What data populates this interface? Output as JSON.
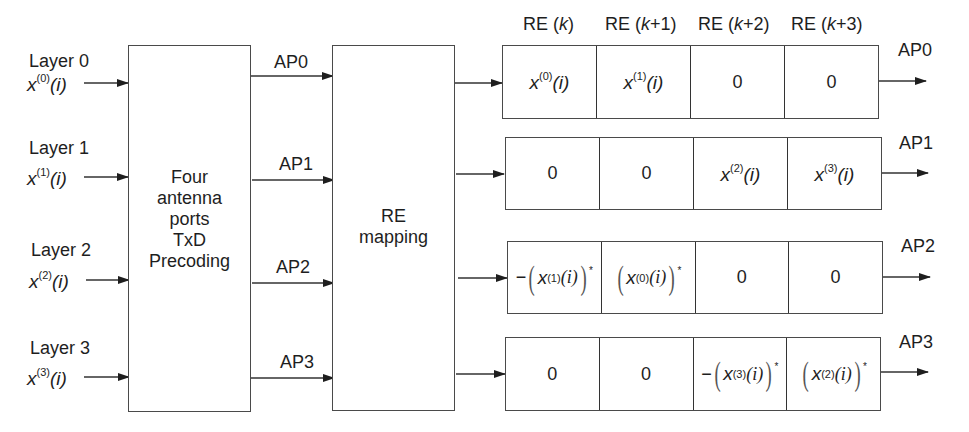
{
  "diagram": {
    "layers": [
      {
        "label": "Layer 0",
        "symbol_base": "x",
        "symbol_sup": "(0)",
        "symbol_arg": "(i)"
      },
      {
        "label": "Layer 1",
        "symbol_base": "x",
        "symbol_sup": "(1)",
        "symbol_arg": "(i)"
      },
      {
        "label": "Layer 2",
        "symbol_base": "x",
        "symbol_sup": "(2)",
        "symbol_arg": "(i)"
      },
      {
        "label": "Layer 3",
        "symbol_base": "x",
        "symbol_sup": "(3)",
        "symbol_arg": "(i)"
      }
    ],
    "precoding_block": {
      "lines": [
        "Four",
        "antenna",
        "ports",
        "TxD",
        "Precoding"
      ]
    },
    "mapping_block": {
      "lines": [
        "RE",
        "mapping"
      ]
    },
    "ap_links": [
      "AP0",
      "AP1",
      "AP2",
      "AP3"
    ],
    "re_headers": [
      {
        "prefix": "RE (",
        "var": "k",
        "suffix": ")"
      },
      {
        "prefix": "RE (",
        "var": "k",
        "suffix": "+1)"
      },
      {
        "prefix": "RE (",
        "var": "k",
        "suffix": "+2)"
      },
      {
        "prefix": "RE (",
        "var": "k",
        "suffix": "+3)"
      }
    ],
    "output_rows": [
      {
        "ap": "AP0",
        "cells": [
          {
            "type": "sym",
            "sup": "(0)"
          },
          {
            "type": "sym",
            "sup": "(1)"
          },
          {
            "type": "zero",
            "text": "0"
          },
          {
            "type": "zero",
            "text": "0"
          }
        ]
      },
      {
        "ap": "AP1",
        "cells": [
          {
            "type": "zero",
            "text": "0"
          },
          {
            "type": "zero",
            "text": "0"
          },
          {
            "type": "sym",
            "sup": "(2)"
          },
          {
            "type": "sym",
            "sup": "(3)"
          }
        ]
      },
      {
        "ap": "AP2",
        "cells": [
          {
            "type": "conj",
            "neg": "−",
            "sup": "(1)"
          },
          {
            "type": "conj",
            "neg": "",
            "sup": "(0)"
          },
          {
            "type": "zero",
            "text": "0"
          },
          {
            "type": "zero",
            "text": "0"
          }
        ]
      },
      {
        "ap": "AP3",
        "cells": [
          {
            "type": "zero",
            "text": "0"
          },
          {
            "type": "zero",
            "text": "0"
          },
          {
            "type": "conj",
            "neg": "−",
            "sup": "(3)"
          },
          {
            "type": "conj",
            "neg": "",
            "sup": "(2)"
          }
        ]
      }
    ],
    "math_tokens": {
      "x": "x",
      "i": "(i)",
      "star": "*",
      "lparen": "(",
      "rparen": ")"
    },
    "colors": {
      "line": "#4a4a4a",
      "text": "#1e1e1e",
      "background": "#ffffff"
    }
  }
}
